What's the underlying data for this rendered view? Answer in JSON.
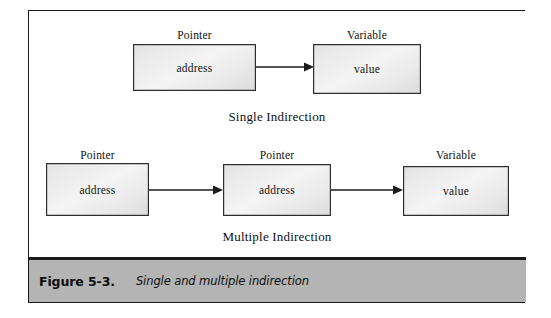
{
  "figure": {
    "number": "Figure 5-3.",
    "title": "Single and multiple indirection"
  },
  "diagrams": [
    {
      "id": "single-indirection",
      "section_label": "Single Indirection",
      "nodes": [
        {
          "label": "Pointer",
          "text": "address"
        },
        {
          "label": "Variable",
          "text": "value"
        }
      ],
      "arrows": 1
    },
    {
      "id": "multiple-indirection",
      "section_label": "Multiple Indirection",
      "nodes": [
        {
          "label": "Pointer",
          "text": "address"
        },
        {
          "label": "Pointer",
          "text": "address"
        },
        {
          "label": "Variable",
          "text": "value"
        }
      ],
      "arrows": 2
    }
  ],
  "colors": {
    "frame_border": "#1a1a1a",
    "box_border": "#2e2e2e",
    "box_fill": "#efefef",
    "caption_bar": "#b4b4b4",
    "arrow": "#1c1c1c",
    "text": "#111111"
  }
}
